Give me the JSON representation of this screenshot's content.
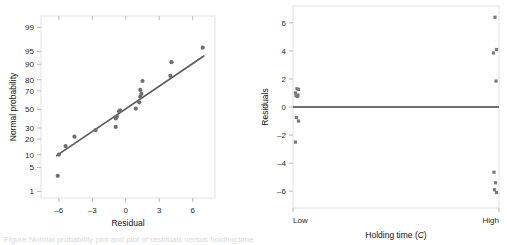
{
  "figure": {
    "background": "#ffffff",
    "caption_fragment": "Figure  Normal probability plot and plot of residuals versus holding time.",
    "marker_color": "#6e6e6e",
    "line_color": "#5b5b5b",
    "frame_color": "#e2e2e2"
  },
  "chart_data": [
    {
      "type": "scatter",
      "id": "normal-probability-plot",
      "title": "",
      "xlabel": "Residual",
      "ylabel": "Normal probability",
      "xlim": [
        -7.6,
        8.0
      ],
      "ylim_probability": [
        0.6,
        99.6
      ],
      "xticks": [
        -6,
        -3,
        0,
        3,
        6
      ],
      "xtick_labels": [
        "–6",
        "–3",
        "0",
        "3",
        "6"
      ],
      "yticks": [
        1,
        5,
        10,
        20,
        30,
        50,
        70,
        80,
        90,
        95,
        99
      ],
      "ytick_labels": [
        "1",
        "5",
        "10",
        "20",
        "30",
        "50",
        "70",
        "80",
        "90",
        "95",
        "99"
      ],
      "grid": false,
      "legend": "none",
      "points": [
        {
          "x": -6.1,
          "p": 3
        },
        {
          "x": -6.0,
          "p": 10
        },
        {
          "x": -5.4,
          "p": 15
        },
        {
          "x": -4.6,
          "p": 22
        },
        {
          "x": -2.7,
          "p": 28
        },
        {
          "x": -0.9,
          "p": 31
        },
        {
          "x": -0.9,
          "p": 40
        },
        {
          "x": -0.8,
          "p": 42
        },
        {
          "x": -0.6,
          "p": 48
        },
        {
          "x": -0.5,
          "p": 49
        },
        {
          "x": 0.9,
          "p": 51
        },
        {
          "x": 1.2,
          "p": 58
        },
        {
          "x": 1.3,
          "p": 64
        },
        {
          "x": 1.4,
          "p": 67
        },
        {
          "x": 1.3,
          "p": 71
        },
        {
          "x": 1.5,
          "p": 79
        },
        {
          "x": 4.0,
          "p": 83
        },
        {
          "x": 4.1,
          "p": 91
        },
        {
          "x": 6.9,
          "p": 96
        }
      ],
      "reference_line": {
        "x1": -6.2,
        "p1": 9.5,
        "x2": 7.0,
        "p2": 93.5
      }
    },
    {
      "type": "scatter",
      "id": "residuals-vs-holding-time",
      "title": "",
      "xlabel": "Holding time (C)",
      "xlabel_plain": "Holding time",
      "xlabel_italic_symbol": "C",
      "ylabel": "Residuals",
      "xlim": [
        0,
        1
      ],
      "ylim": [
        -7.2,
        7.2
      ],
      "xticks": [
        0,
        1
      ],
      "xtick_labels": [
        "Low",
        "High"
      ],
      "yticks": [
        -6,
        -4,
        -2,
        0,
        2,
        4,
        6
      ],
      "ytick_labels": [
        "–6",
        "–4",
        "–2",
        "0",
        "2",
        "4",
        "6"
      ],
      "grid": false,
      "legend": "none",
      "zero_reference_line": 0,
      "series": [
        {
          "name": "Low",
          "x": 0,
          "values": [
            1.3,
            1.25,
            1.0,
            0.85,
            0.8,
            0.75,
            -0.75,
            -1.0,
            -2.5
          ]
        },
        {
          "name": "High",
          "x": 1,
          "values": [
            6.4,
            4.1,
            3.85,
            1.85,
            -4.65,
            -5.4,
            -5.9,
            -6.1
          ]
        }
      ]
    }
  ]
}
